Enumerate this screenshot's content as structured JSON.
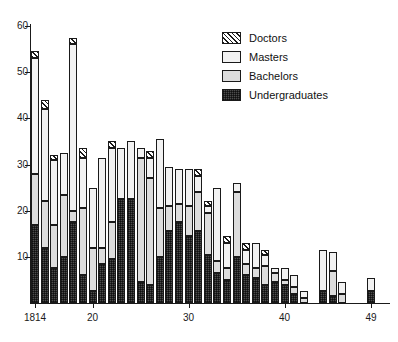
{
  "chart_data": {
    "type": "bar",
    "subtype": "stacked",
    "title": "",
    "xlabel": "",
    "ylabel": "",
    "xlim": [
      1814,
      1849
    ],
    "ylim": [
      0,
      60
    ],
    "ytick_values": [
      10,
      20,
      30,
      40,
      50,
      60
    ],
    "ytick_labels": [
      "10",
      "20",
      "30",
      "40",
      "50",
      "60"
    ],
    "xtick_values": [
      1814,
      1820,
      1830,
      1840,
      1849
    ],
    "xtick_labels": [
      "1814",
      "20",
      "30",
      "40",
      "49"
    ],
    "grid": false,
    "legend_position": "top-right",
    "categories": [
      "1814",
      "1815",
      "1816",
      "1817",
      "1818",
      "1819",
      "1820",
      "1821",
      "1822",
      "1823",
      "1824",
      "1825",
      "1826",
      "1827",
      "1828",
      "1829",
      "1830",
      "1831",
      "1832",
      "1833",
      "1834",
      "1835",
      "1836",
      "1837",
      "1838",
      "1839",
      "1840",
      "1841",
      "1842",
      "1843",
      "1844",
      "1845",
      "1846",
      "1847",
      "1848",
      "1849"
    ],
    "series": [
      {
        "name": "Undergraduates",
        "color": "#4d4d4d",
        "pattern": "cross-stipple",
        "values": [
          17,
          12,
          7.5,
          10,
          17.5,
          6,
          2.5,
          8.5,
          9.5,
          22.5,
          22.5,
          4.5,
          4,
          10,
          15.5,
          17.5,
          14.5,
          15.5,
          10.5,
          6.5,
          5,
          10,
          6,
          5.5,
          4,
          4.5,
          4,
          2,
          0,
          0,
          2.5,
          1.5,
          0,
          0,
          0,
          2.5
        ]
      },
      {
        "name": "Bachelors",
        "color": "#dcdcdc",
        "pattern": "solid-light",
        "values": [
          11,
          10,
          9.5,
          13.5,
          2.5,
          14.5,
          9.5,
          3.5,
          8,
          0,
          0,
          27,
          23,
          10.5,
          5.5,
          4,
          6.5,
          8.5,
          9,
          2.5,
          2.5,
          14,
          2.5,
          2,
          4,
          2,
          1,
          1.5,
          1,
          0,
          0,
          5.5,
          2,
          0,
          0,
          0
        ]
      },
      {
        "name": "Masters",
        "color": "#f2f2f2",
        "pattern": "dotted",
        "values": [
          25,
          20,
          14,
          9,
          36,
          11,
          13,
          19.5,
          16,
          11,
          12.5,
          2,
          4.5,
          15,
          8.5,
          7.5,
          8,
          3.5,
          1.5,
          16,
          5.5,
          2,
          3,
          5.5,
          2.5,
          1,
          2.5,
          2.5,
          1.5,
          0,
          9,
          4,
          2.5,
          0,
          0,
          3
        ]
      },
      {
        "name": "Doctors",
        "color": "#e8e8e8",
        "pattern": "diagonal-hatch",
        "values": [
          1.5,
          2,
          1,
          0,
          1.5,
          2,
          0,
          0,
          1.5,
          0,
          0,
          0,
          1.5,
          0,
          0,
          0,
          0,
          1.5,
          1,
          0,
          1.5,
          0,
          1.5,
          0,
          1,
          0,
          0,
          0,
          0,
          0,
          0,
          0,
          0,
          0,
          0,
          0
        ]
      }
    ]
  },
  "legend": {
    "items": [
      {
        "label": "Doctors",
        "swatch": "doctors-swatch"
      },
      {
        "label": "Masters",
        "swatch": "masters-swatch"
      },
      {
        "label": "Bachelors",
        "swatch": "bachelors-swatch"
      },
      {
        "label": "Undergraduates",
        "swatch": "undergraduates-swatch"
      }
    ]
  },
  "axes": {
    "y_labels": [
      "60",
      "50",
      "40",
      "30",
      "20",
      "10"
    ],
    "x_labels": [
      "1814",
      "20",
      "30",
      "40",
      "49"
    ]
  }
}
